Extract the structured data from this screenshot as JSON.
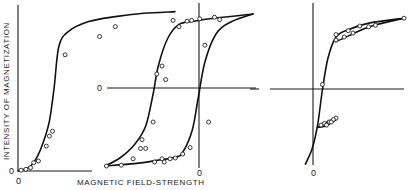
{
  "chart_data": {
    "type": "line",
    "title": "",
    "xlabel": "MAGNETIC FIELD-STRENGTH",
    "ylabel": "INTENSITY OF MAGNETIZATION",
    "grid": false,
    "legend": "none",
    "origin_labels": [
      "0",
      "0",
      "0",
      "0",
      "0"
    ],
    "panels": [
      {
        "name": "initial-magnetization-curve",
        "description": "Virgin magnetization curve starting at origin, saturating at high field",
        "xlim": [
          0,
          1
        ],
        "ylim": [
          0,
          1
        ],
        "series": [
          {
            "name": "virgin-curve",
            "points": [
              [
                0.0,
                0.0
              ],
              [
                0.04,
                0.01
              ],
              [
                0.08,
                0.03
              ],
              [
                0.12,
                0.08
              ],
              [
                0.16,
                0.17
              ],
              [
                0.2,
                0.3
              ],
              [
                0.23,
                0.5
              ],
              [
                0.26,
                0.75
              ],
              [
                0.32,
                0.84
              ],
              [
                0.45,
                0.9
              ],
              [
                0.62,
                0.93
              ],
              [
                0.8,
                0.95
              ],
              [
                1.0,
                0.96
              ]
            ]
          }
        ],
        "markers": [
          [
            0.02,
            0.005
          ],
          [
            0.05,
            0.01
          ],
          [
            0.08,
            0.02
          ],
          [
            0.1,
            0.05
          ],
          [
            0.13,
            0.06
          ],
          [
            0.18,
            0.15
          ],
          [
            0.2,
            0.21
          ],
          [
            0.22,
            0.24
          ],
          [
            0.3,
            0.7
          ],
          [
            0.52,
            0.81
          ],
          [
            0.62,
            0.87
          ]
        ]
      },
      {
        "name": "hysteresis-loop",
        "description": "Full symmetric hysteresis loop centered at origin",
        "xlim": [
          -1,
          1
        ],
        "ylim": [
          -1,
          1
        ],
        "series": [
          {
            "name": "descending-branch",
            "points": [
              [
                1.0,
                0.95
              ],
              [
                0.5,
                0.9
              ],
              [
                0.2,
                0.86
              ],
              [
                0.0,
                0.82
              ],
              [
                -0.15,
                0.65
              ],
              [
                -0.28,
                0.3
              ],
              [
                -0.35,
                -0.05
              ],
              [
                -0.45,
                -0.45
              ],
              [
                -0.6,
                -0.68
              ],
              [
                -0.8,
                -0.85
              ],
              [
                -1.0,
                -0.95
              ]
            ]
          },
          {
            "name": "ascending-branch",
            "points": [
              [
                -1.0,
                -0.95
              ],
              [
                -0.6,
                -0.92
              ],
              [
                -0.3,
                -0.88
              ],
              [
                -0.05,
                -0.84
              ],
              [
                0.05,
                -0.78
              ],
              [
                0.18,
                -0.5
              ],
              [
                0.26,
                -0.1
              ],
              [
                0.35,
                0.35
              ],
              [
                0.5,
                0.7
              ],
              [
                0.7,
                0.85
              ],
              [
                1.0,
                0.95
              ]
            ]
          }
        ],
        "markers": [
          [
            -0.98,
            -0.95
          ],
          [
            -0.78,
            -0.94
          ],
          [
            -0.62,
            -0.86
          ],
          [
            -0.52,
            -0.73
          ],
          [
            -0.45,
            -0.73
          ],
          [
            -0.5,
            -0.62
          ],
          [
            -0.35,
            -0.4
          ],
          [
            -0.18,
            0.13
          ],
          [
            -0.23,
            0.3
          ],
          [
            -0.3,
            0.2
          ],
          [
            -0.08,
            0.87
          ],
          [
            0.0,
            0.79
          ],
          [
            0.11,
            0.86
          ],
          [
            0.17,
            0.87
          ],
          [
            0.28,
            0.89
          ],
          [
            0.48,
            0.91
          ],
          [
            0.55,
            0.88
          ],
          [
            0.35,
            0.56
          ],
          [
            0.15,
            -0.72
          ],
          [
            0.05,
            -0.8
          ],
          [
            -0.05,
            -0.85
          ],
          [
            -0.12,
            -0.86
          ],
          [
            -0.23,
            -0.86
          ],
          [
            -0.33,
            -0.9
          ],
          [
            -0.2,
            -0.9
          ],
          [
            0.4,
            -0.4
          ]
        ]
      },
      {
        "name": "minor-loops",
        "description": "Descending branch with small minor hysteresis loops near remanence and at negative field",
        "xlim": [
          -1,
          1
        ],
        "ylim": [
          -1,
          1
        ],
        "series": [
          {
            "name": "main-descending",
            "points": [
              [
                1.0,
                0.92
              ],
              [
                0.5,
                0.86
              ],
              [
                0.2,
                0.78
              ],
              [
                0.0,
                0.68
              ],
              [
                -0.12,
                0.4
              ],
              [
                -0.2,
                0.0
              ],
              [
                -0.27,
                -0.45
              ],
              [
                -0.35,
                -0.75
              ],
              [
                -0.45,
                -0.95
              ]
            ]
          },
          {
            "name": "upper-minor-loop",
            "points": [
              [
                0.0,
                0.62
              ],
              [
                0.2,
                0.7
              ],
              [
                0.4,
                0.78
              ],
              [
                0.6,
                0.84
              ],
              [
                1.0,
                0.92
              ]
            ]
          },
          {
            "name": "lower-minor-loop-a",
            "points": [
              [
                -0.27,
                -0.48
              ],
              [
                -0.15,
                -0.42
              ],
              [
                -0.05,
                -0.38
              ],
              [
                0.0,
                -0.36
              ]
            ]
          },
          {
            "name": "lower-minor-loop-b",
            "points": [
              [
                -0.27,
                -0.48
              ],
              [
                -0.15,
                -0.46
              ],
              [
                -0.05,
                -0.41
              ],
              [
                0.0,
                -0.38
              ]
            ]
          }
        ],
        "markers": [
          [
            0.0,
            0.71
          ],
          [
            0.0,
            0.64
          ],
          [
            0.18,
            0.76
          ],
          [
            0.35,
            0.82
          ],
          [
            0.48,
            0.81
          ],
          [
            0.58,
            0.83
          ],
          [
            0.25,
            0.73
          ],
          [
            0.12,
            0.68
          ],
          [
            -0.2,
            0.07
          ],
          [
            0.0,
            -0.36
          ],
          [
            -0.04,
            -0.38
          ],
          [
            -0.1,
            -0.41
          ],
          [
            -0.17,
            -0.43
          ],
          [
            -0.22,
            -0.45
          ],
          [
            -0.07,
            -0.41
          ],
          [
            -0.14,
            -0.45
          ],
          [
            1.0,
            0.92
          ]
        ]
      }
    ]
  }
}
